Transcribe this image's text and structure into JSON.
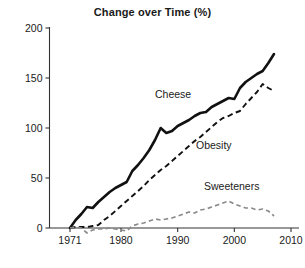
{
  "chart_data": {
    "type": "line",
    "title": "Change over Time (%)",
    "xlabel": "",
    "ylabel": "",
    "xlim": [
      1968,
      2012
    ],
    "ylim": [
      0,
      200
    ],
    "grid": false,
    "legend_position": "inline-annotations",
    "xticks": [
      1971,
      1980,
      1990,
      2000,
      2010
    ],
    "yticks": [
      0,
      50,
      100,
      150,
      200
    ],
    "x": [
      1971,
      1972,
      1973,
      1974,
      1975,
      1976,
      1977,
      1978,
      1979,
      1980,
      1981,
      1982,
      1983,
      1984,
      1985,
      1986,
      1987,
      1988,
      1989,
      1990,
      1991,
      1992,
      1993,
      1994,
      1995,
      1996,
      1997,
      1998,
      1999,
      2000,
      2001,
      2002,
      2003,
      2004,
      2005,
      2006,
      2007
    ],
    "series": [
      {
        "name": "Cheese",
        "style": "solid",
        "color": "#111111",
        "values": [
          0,
          8,
          14,
          21,
          20,
          26,
          31,
          36,
          40,
          43,
          46,
          57,
          63,
          70,
          78,
          88,
          100,
          95,
          97,
          102,
          105,
          108,
          112,
          115,
          116,
          121,
          124,
          127,
          130,
          129,
          140,
          146,
          150,
          154,
          157,
          165,
          174
        ]
      },
      {
        "name": "Obesity",
        "style": "dashed",
        "color": "#111111",
        "values": [
          0,
          1,
          1,
          1,
          2,
          3,
          8,
          12,
          17,
          22,
          27,
          32,
          37,
          42,
          48,
          53,
          58,
          62,
          67,
          72,
          77,
          82,
          87,
          91,
          96,
          101,
          106,
          110,
          112,
          115,
          117,
          124,
          130,
          136,
          144,
          140,
          137
        ]
      },
      {
        "name": "Sweeteners",
        "style": "dashed",
        "color": "#8a8a8a",
        "values": [
          0,
          1,
          0,
          -5,
          -2,
          -1,
          -1,
          0,
          -1,
          -2,
          -3,
          2,
          4,
          5,
          7,
          9,
          8,
          9,
          10,
          12,
          14,
          16,
          15,
          18,
          19,
          21,
          23,
          25,
          27,
          24,
          22,
          20,
          20,
          18,
          19,
          17,
          12
        ]
      }
    ],
    "annotations": [
      {
        "text": "Cheese",
        "x_px": 155,
        "y_px": 98
      },
      {
        "text": "Obesity",
        "x_px": 196,
        "y_px": 149
      },
      {
        "text": "Sweeteners",
        "x_px": 204,
        "y_px": 190
      }
    ]
  }
}
